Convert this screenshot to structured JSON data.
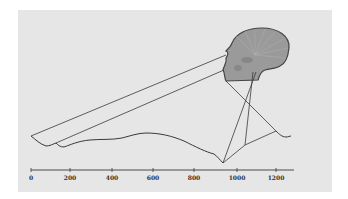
{
  "figure": {
    "background_color": "#e6e6e6",
    "line_color": "#3a3a3a",
    "skull_fill": "#9a9a9a",
    "skull_outline": "#444444"
  },
  "axis": {
    "ticks": [
      {
        "label": "0",
        "x": 31
      },
      {
        "label": "200",
        "x": 70
      },
      {
        "label": "400",
        "x": 112
      },
      {
        "label": "600",
        "x": 153
      },
      {
        "label": "800",
        "x": 194
      },
      {
        "label": "1000",
        "x": 237
      },
      {
        "label": "1200",
        "x": 276
      }
    ]
  }
}
